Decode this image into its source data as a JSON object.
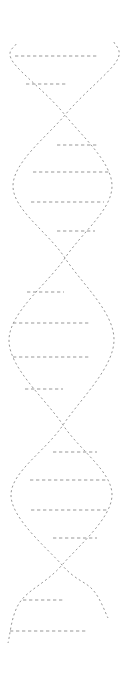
{
  "illustration": {
    "subject": "dna-double-helix",
    "background_color": "#ffffff",
    "stroke_color": "#979797",
    "stroke_width": 1,
    "strand_dash": "2.1 2.7",
    "rung_dash": "3.3 2.7",
    "canvas": {
      "width": 131,
      "height": 676
    },
    "crossings": [
      {
        "x": 65,
        "y": 115
      },
      {
        "x": 65,
        "y": 258
      },
      {
        "x": 63,
        "y": 425
      },
      {
        "x": 62,
        "y": 565
      }
    ],
    "strands": [
      {
        "name": "strand-left-start",
        "points": [
          [
            16,
            44
          ],
          [
            13,
            62
          ],
          [
            65,
            115
          ],
          [
            112,
            186
          ],
          [
            65,
            258
          ],
          [
            9,
            340
          ],
          [
            63,
            425
          ],
          [
            112,
            495
          ],
          [
            62,
            565
          ],
          [
            20,
            602
          ],
          [
            8,
            643
          ]
        ]
      },
      {
        "name": "strand-right-start",
        "points": [
          [
            114,
            42
          ],
          [
            116,
            62
          ],
          [
            65,
            115
          ],
          [
            13,
            186
          ],
          [
            65,
            258
          ],
          [
            114,
            340
          ],
          [
            63,
            425
          ],
          [
            11,
            495
          ],
          [
            62,
            565
          ],
          [
            93,
            590
          ],
          [
            108,
            618
          ]
        ]
      }
    ],
    "rungs": [
      {
        "y": 56,
        "x1": 15,
        "x2": 97
      },
      {
        "y": 84,
        "x1": 26,
        "x2": 68
      },
      {
        "y": 145,
        "x1": 57,
        "x2": 97
      },
      {
        "y": 172,
        "x1": 33,
        "x2": 110
      },
      {
        "y": 202,
        "x1": 31,
        "x2": 104
      },
      {
        "y": 231,
        "x1": 57,
        "x2": 95
      },
      {
        "y": 292,
        "x1": 27,
        "x2": 64
      },
      {
        "y": 323,
        "x1": 13,
        "x2": 89
      },
      {
        "y": 357,
        "x1": 13,
        "x2": 90
      },
      {
        "y": 389,
        "x1": 25,
        "x2": 63
      },
      {
        "y": 452,
        "x1": 53,
        "x2": 97
      },
      {
        "y": 480,
        "x1": 30,
        "x2": 108
      },
      {
        "y": 510,
        "x1": 31,
        "x2": 108
      },
      {
        "y": 538,
        "x1": 53,
        "x2": 97
      },
      {
        "y": 600,
        "x1": 23,
        "x2": 63
      },
      {
        "y": 631,
        "x1": 10,
        "x2": 88
      }
    ]
  }
}
